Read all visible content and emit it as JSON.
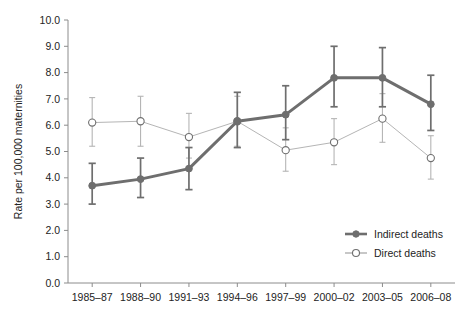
{
  "chart_data": {
    "type": "line",
    "title": "",
    "subtitle": "",
    "xlabel": "",
    "ylabel": "Rate per 100,000 maternities",
    "ylim": [
      0.0,
      10.0
    ],
    "ytick_step": 1.0,
    "grid": false,
    "legend_position": "inside-bottom-right",
    "error_bars": "95% confidence interval",
    "categories": [
      "1985–87",
      "1988–90",
      "1991–93",
      "1994–96",
      "1997–99",
      "2000–02",
      "2003–05",
      "2006–08"
    ],
    "ytick_labels": [
      "0.0",
      "1.0",
      "2.0",
      "3.0",
      "4.0",
      "5.0",
      "6.0",
      "7.0",
      "8.0",
      "9.0",
      "10.0"
    ],
    "ytick_values": [
      0.0,
      1.0,
      2.0,
      3.0,
      4.0,
      5.0,
      6.0,
      7.0,
      8.0,
      9.0,
      10.0
    ],
    "series": [
      {
        "name": "Indirect deaths",
        "marker": "filled-circle",
        "color": "#6e6e6e",
        "line_width": 3,
        "values": [
          3.7,
          3.95,
          4.35,
          6.15,
          6.4,
          7.8,
          7.8,
          6.8
        ],
        "ci_low": [
          3.0,
          3.25,
          3.55,
          5.15,
          5.45,
          6.7,
          6.7,
          5.8
        ],
        "ci_high": [
          4.55,
          4.75,
          5.15,
          7.25,
          7.5,
          9.0,
          8.95,
          7.9
        ]
      },
      {
        "name": "Direct deaths",
        "marker": "open-circle",
        "color": "#b5b5b5",
        "line_width": 1,
        "values": [
          6.1,
          6.15,
          5.55,
          6.15,
          5.05,
          5.35,
          6.25,
          4.75
        ],
        "ci_low": [
          5.2,
          5.2,
          4.75,
          5.2,
          4.25,
          4.5,
          5.35,
          3.95
        ],
        "ci_high": [
          7.05,
          7.1,
          6.45,
          7.1,
          5.9,
          6.25,
          7.2,
          5.6
        ]
      }
    ]
  },
  "legend": {
    "entries": [
      {
        "label": "Indirect deaths",
        "marker": "filled-circle",
        "color": "#6e6e6e"
      },
      {
        "label": "Direct deaths",
        "marker": "open-circle",
        "color": "#9a9a9a"
      }
    ]
  },
  "axes": {
    "y_title": "Rate per 100,000 maternities",
    "axis_color": "#8c8c8c"
  }
}
